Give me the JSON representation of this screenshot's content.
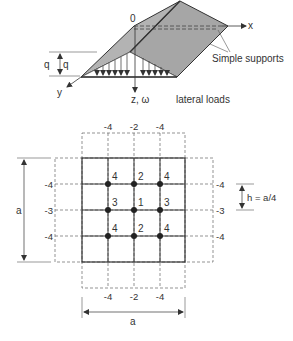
{
  "figure_top": {
    "origin_label": "0",
    "x_axis_label": "x",
    "y_axis_label": "y",
    "z_axis_label": "z, ω",
    "q_label_left": "q",
    "q_label_right": "q",
    "supports_label": "Simple supports",
    "loads_label": "lateral loads",
    "colors": {
      "plate": "#a8a8a8",
      "plate_dark": "#9a9a9a",
      "edge": "#333333"
    }
  },
  "figure_grid": {
    "top_labels": [
      "-4",
      "-2",
      "-4"
    ],
    "bottom_labels": [
      "-4",
      "-2",
      "-4"
    ],
    "left_labels": [
      "-4",
      "-3",
      "-4"
    ],
    "right_labels": [
      "-4",
      "-3",
      "-4"
    ],
    "node_labels": [
      [
        "4",
        "2",
        "4"
      ],
      [
        "3",
        "1",
        "3"
      ],
      [
        "4",
        "2",
        "4"
      ]
    ],
    "spacing_label": "h = a/4",
    "vertical_dim_label": "a",
    "horizontal_dim_label": "a"
  }
}
